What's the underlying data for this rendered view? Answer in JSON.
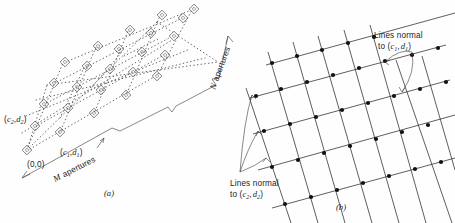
{
  "figure": {
    "background_color": "#fefefe",
    "ink_color": "#1c1c1c",
    "panels": [
      {
        "id": "a",
        "caption": "(a)",
        "description": "Perspective view of an M x N rectangular lattice of apertures joined by dotted rows"
      },
      {
        "id": "b",
        "caption": "(b)",
        "description": "Plane lattice formed by two families of normal lines intersecting at filled nodes"
      }
    ]
  },
  "panel_a": {
    "caption": "(a)",
    "labels": {
      "origin": "(0,0)",
      "vector1_open": "(",
      "vector1_c": "c",
      "vector1_c_sub": "1",
      "vector1_comma": ",",
      "vector1_d": "d",
      "vector1_d_sub": "1",
      "vector1_close": ")",
      "vector2_open": "(",
      "vector2_c": "c",
      "vector2_c_sub": "2",
      "vector2_comma": ",",
      "vector2_d": "d",
      "vector2_d_sub": "2",
      "vector2_close": ")",
      "m_axis_letter": "M",
      "m_axis_word": "apertures",
      "n_axis_letter": "N",
      "n_axis_word": "apertures"
    },
    "lattice": {
      "rows": 5,
      "cols": 5,
      "marker": "diamond-aperture",
      "connector": "dotted-line"
    }
  },
  "panel_b": {
    "caption": "(b)",
    "annotations": [
      {
        "id": "normal-c1-d1",
        "line1": "Lines normal",
        "line2_prefix": "to (",
        "line2_c": "c",
        "line2_c_sub": "1",
        "line2_comma": ",",
        "line2_d": "d",
        "line2_d_sub": "1",
        "line2_suffix": ")",
        "leader_count": 2
      },
      {
        "id": "normal-c2-d2",
        "line1": "Lines normal",
        "line2_prefix": "to (",
        "line2_c": "c",
        "line2_c_sub": "2",
        "line2_comma": ",",
        "line2_d": "d",
        "line2_d_sub": "2",
        "line2_suffix": ")",
        "leader_count": 3
      }
    ],
    "lattice": {
      "shallow_lines": 5,
      "steep_lines": 8,
      "node_marker": "filled-circle",
      "node_color": "#111111"
    }
  }
}
